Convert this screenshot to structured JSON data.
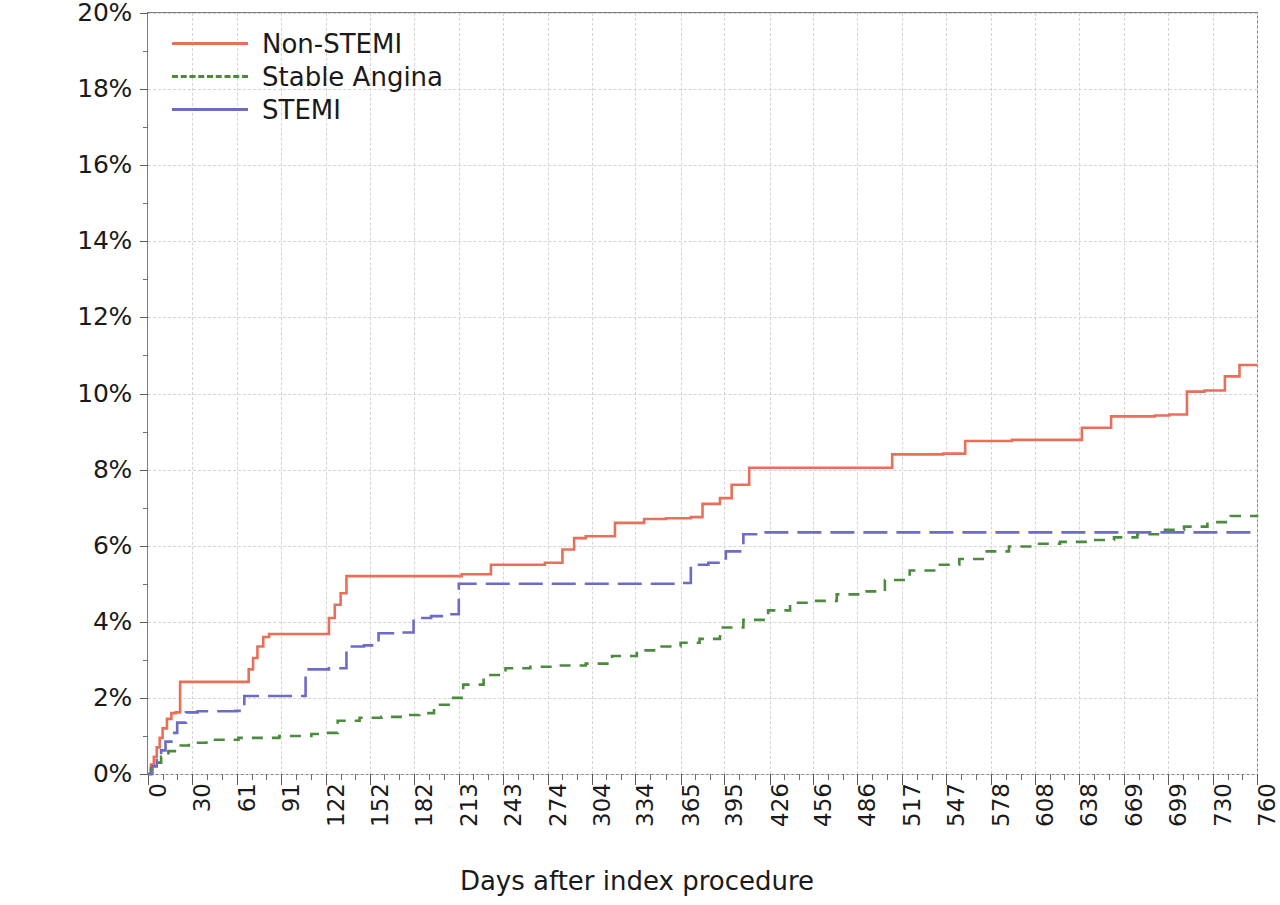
{
  "chart_data": {
    "type": "line",
    "title": "",
    "xlabel": "Days after index procedure",
    "ylabel": "% patients",
    "xlim": [
      0,
      760
    ],
    "ylim": [
      0,
      20
    ],
    "grid": true,
    "legend_position": "top-left",
    "y_ticks": [
      "0%",
      "2%",
      "4%",
      "6%",
      "8%",
      "10%",
      "12%",
      "14%",
      "16%",
      "18%",
      "20%"
    ],
    "y_tick_values": [
      0,
      2,
      4,
      6,
      8,
      10,
      12,
      14,
      16,
      18,
      20
    ],
    "x_ticks": [
      "0",
      "30",
      "61",
      "91",
      "122",
      "152",
      "182",
      "213",
      "243",
      "274",
      "304",
      "334",
      "365",
      "395",
      "426",
      "456",
      "486",
      "517",
      "547",
      "578",
      "608",
      "638",
      "669",
      "699",
      "730",
      "760"
    ],
    "x_tick_values": [
      0,
      30,
      61,
      91,
      122,
      152,
      182,
      213,
      243,
      274,
      304,
      334,
      365,
      395,
      426,
      456,
      486,
      517,
      547,
      578,
      608,
      638,
      669,
      699,
      730,
      760
    ],
    "series": [
      {
        "name": "Non-STEMI",
        "color": "#e8705a",
        "dash": "solid",
        "step": "post",
        "x": [
          0,
          2,
          4,
          6,
          8,
          10,
          13,
          16,
          19,
          22,
          26,
          66,
          69,
          72,
          75,
          79,
          83,
          88,
          120,
          124,
          128,
          132,
          136,
          140,
          185,
          200,
          215,
          235,
          250,
          262,
          272,
          284,
          292,
          300,
          320,
          340,
          355,
          365,
          372,
          380,
          392,
          400,
          412,
          425,
          460,
          478,
          510,
          545,
          560,
          592,
          640,
          660,
          672,
          690,
          700,
          712,
          724,
          738,
          748,
          760
        ],
        "y": [
          0.0,
          0.25,
          0.45,
          0.7,
          0.95,
          1.2,
          1.45,
          1.6,
          1.62,
          2.42,
          2.42,
          2.42,
          2.75,
          3.05,
          3.35,
          3.6,
          3.68,
          3.68,
          3.68,
          4.1,
          4.45,
          4.75,
          5.2,
          5.2,
          5.2,
          5.2,
          5.25,
          5.5,
          5.5,
          5.5,
          5.55,
          5.9,
          6.2,
          6.25,
          6.6,
          6.7,
          6.72,
          6.72,
          6.75,
          7.1,
          7.25,
          7.6,
          8.05,
          8.05,
          8.05,
          8.05,
          8.4,
          8.42,
          8.75,
          8.78,
          9.1,
          9.4,
          9.4,
          9.42,
          9.45,
          10.05,
          10.08,
          10.45,
          10.75,
          10.75
        ]
      },
      {
        "name": "Stable Angina",
        "color": "#4a8b3c",
        "dash": "dashed",
        "step": "post",
        "x": [
          0,
          2,
          5,
          9,
          14,
          20,
          28,
          40,
          62,
          90,
          112,
          122,
          130,
          145,
          160,
          175,
          186,
          196,
          206,
          216,
          230,
          245,
          262,
          280,
          300,
          318,
          335,
          352,
          365,
          378,
          392,
          408,
          425,
          440,
          455,
          472,
          488,
          505,
          522,
          540,
          556,
          572,
          590,
          608,
          625,
          645,
          662,
          678,
          694,
          710,
          726,
          742,
          760
        ],
        "y": [
          0.0,
          0.15,
          0.3,
          0.45,
          0.6,
          0.75,
          0.82,
          0.9,
          0.95,
          1.0,
          1.05,
          1.08,
          1.4,
          1.48,
          1.5,
          1.55,
          1.6,
          1.82,
          2.0,
          2.35,
          2.6,
          2.78,
          2.82,
          2.85,
          2.9,
          3.1,
          3.25,
          3.35,
          3.45,
          3.55,
          3.85,
          4.05,
          4.3,
          4.5,
          4.55,
          4.72,
          4.8,
          5.1,
          5.35,
          5.5,
          5.65,
          5.85,
          5.98,
          6.05,
          6.1,
          6.15,
          6.22,
          6.3,
          6.42,
          6.5,
          6.62,
          6.78,
          6.82
        ]
      },
      {
        "name": "STEMI",
        "color": "#6c6bc8",
        "dash": "dashed-long",
        "step": "post",
        "x": [
          0,
          3,
          6,
          9,
          12,
          16,
          20,
          26,
          34,
          60,
          66,
          74,
          98,
          108,
          124,
          136,
          148,
          158,
          170,
          182,
          194,
          204,
          213,
          350,
          362,
          372,
          384,
          396,
          408,
          420,
          760
        ],
        "y": [
          0.0,
          0.2,
          0.42,
          0.62,
          0.85,
          1.08,
          1.35,
          1.62,
          1.65,
          1.66,
          2.05,
          2.05,
          2.05,
          2.75,
          2.78,
          3.35,
          3.38,
          3.7,
          3.72,
          4.1,
          4.15,
          4.2,
          5.0,
          5.0,
          5.02,
          5.5,
          5.55,
          5.85,
          6.3,
          6.35,
          6.35
        ]
      }
    ]
  },
  "legend": {
    "items": [
      {
        "label": "Non-STEMI",
        "color": "#e8705a",
        "dash": "solid"
      },
      {
        "label": "Stable Angina",
        "color": "#4a8b3c",
        "dash": "dashed"
      },
      {
        "label": "STEMI",
        "color": "#6c6bc8",
        "dash": "dashed-long"
      }
    ]
  },
  "axis_titles": {
    "x": "Days after index procedure",
    "y": "% patients"
  }
}
